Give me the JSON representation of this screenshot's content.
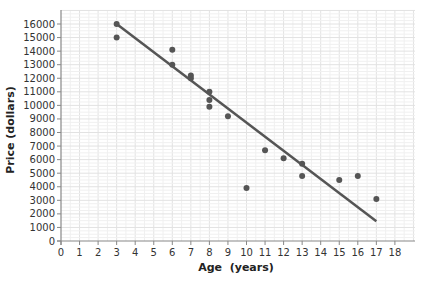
{
  "chart_data": {
    "type": "scatter",
    "title": "",
    "xlabel": "Age  (years)",
    "ylabel": "Price (dollars)",
    "xlim": [
      0,
      18
    ],
    "ylim": [
      0,
      16000
    ],
    "x_ticks": [
      0,
      1,
      2,
      3,
      4,
      5,
      6,
      7,
      8,
      9,
      10,
      11,
      12,
      13,
      14,
      15,
      16,
      17,
      18
    ],
    "y_ticks": [
      0,
      1000,
      2000,
      3000,
      4000,
      5000,
      6000,
      7000,
      8000,
      9000,
      10000,
      11000,
      12000,
      13000,
      14000,
      15000,
      16000
    ],
    "grid": true,
    "legend": null,
    "series": [
      {
        "name": "data",
        "points": [
          {
            "x": 3,
            "y": 16000
          },
          {
            "x": 3,
            "y": 15000
          },
          {
            "x": 6,
            "y": 14100
          },
          {
            "x": 6,
            "y": 13000
          },
          {
            "x": 7,
            "y": 12200
          },
          {
            "x": 7,
            "y": 12000
          },
          {
            "x": 8,
            "y": 11000
          },
          {
            "x": 8,
            "y": 10400
          },
          {
            "x": 8,
            "y": 9900
          },
          {
            "x": 9,
            "y": 9200
          },
          {
            "x": 10,
            "y": 3900
          },
          {
            "x": 11,
            "y": 6700
          },
          {
            "x": 12,
            "y": 6100
          },
          {
            "x": 13,
            "y": 5700
          },
          {
            "x": 13,
            "y": 4800
          },
          {
            "x": 15,
            "y": 4500
          },
          {
            "x": 16,
            "y": 4800
          },
          {
            "x": 17,
            "y": 3100
          }
        ]
      }
    ],
    "trend_line": {
      "x1": 3,
      "y1": 16000,
      "x2": 17,
      "y2": 1450
    },
    "colors": {
      "points": "#555555",
      "line": "#555555",
      "axis": "#888888",
      "grid": "#e6e6e6"
    }
  }
}
